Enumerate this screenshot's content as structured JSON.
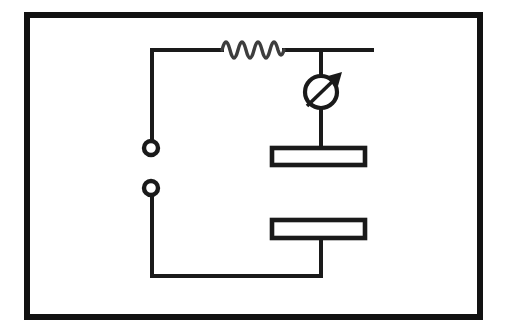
{
  "figure": {
    "background_color": "#ffffff",
    "line_color": "#1a1a1a",
    "frame_color": "#111111",
    "resistor_color": "#3d3d3d",
    "width": 505,
    "height": 335
  },
  "frame": {
    "label": "diagram-border",
    "x": 27,
    "y": 15,
    "width": 453,
    "height": 302,
    "stroke_width": 6
  },
  "components": {
    "resistor": {
      "label": "resistor",
      "symbol": "zigzag-coil",
      "peaks": 5,
      "x_start": 222,
      "x_end": 284,
      "y": 50,
      "amplitude": 11
    },
    "meter": {
      "label": "meter",
      "symbol": "circle-with-diagonal-arrow",
      "center_x": 321,
      "center_y": 92,
      "radius": 16,
      "arrow_from_x": 307,
      "arrow_from_y": 106,
      "arrow_to_x": 340,
      "arrow_to_y": 74
    },
    "upper_plate": {
      "label": "upper-plate",
      "symbol": "hollow-rectangle",
      "x": 272,
      "y": 148,
      "width": 93,
      "height": 17
    },
    "lower_plate": {
      "label": "lower-plate",
      "symbol": "hollow-rectangle",
      "x": 272,
      "y": 220,
      "width": 93,
      "height": 18
    },
    "terminal_upper": {
      "label": "upper-terminal",
      "symbol": "open-circle",
      "center_x": 151,
      "center_y": 148,
      "radius": 7
    },
    "terminal_lower": {
      "label": "lower-terminal",
      "symbol": "open-circle",
      "center_x": 151,
      "center_y": 188,
      "radius": 7
    }
  },
  "wires": {
    "top_rail": {
      "label": "top-rail-wire",
      "path": "M 152 50 L 222 50 M 284 50 L 372 50"
    },
    "left_upper_branch": {
      "label": "left-upper-branch-wire",
      "path": "M 152 50 L 152 141"
    },
    "left_lower_branch": {
      "label": "left-lower-branch-wire",
      "path": "M 152 195 L 152 276 L 321 276"
    },
    "meter_top_lead": {
      "label": "meter-top-lead-wire",
      "path": "M 321 50 L 321 76"
    },
    "meter_bottom_lead": {
      "label": "meter-bottom-lead-wire",
      "path": "M 321 108 L 321 148"
    },
    "lower_plate_lead": {
      "label": "lower-plate-lead-wire",
      "path": "M 321 238 L 321 276"
    }
  }
}
